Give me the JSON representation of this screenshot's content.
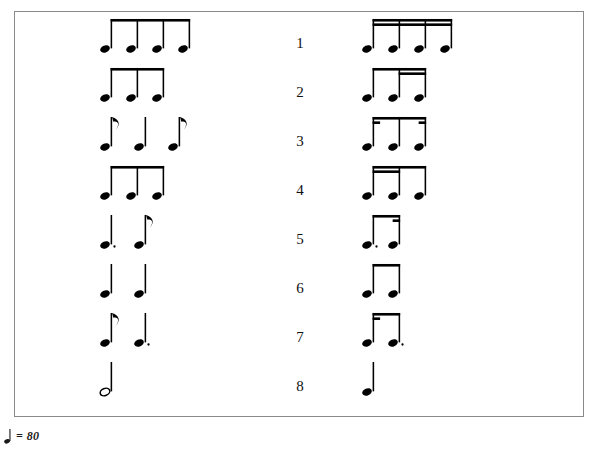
{
  "document": {
    "type": "rhythm-dictation-worksheet",
    "border_color": "#8a8a8a",
    "ink_color": "#000000"
  },
  "tempo": {
    "note_icon": "quarter-note-icon",
    "equals": "=",
    "bpm": "80",
    "text": "= 80"
  },
  "rows": [
    {
      "number": "1",
      "left": {
        "description": "four eighth notes beamed",
        "notes": [
          {
            "value": "eighth",
            "dotted": false
          },
          {
            "value": "eighth",
            "dotted": false
          },
          {
            "value": "eighth",
            "dotted": false
          },
          {
            "value": "eighth",
            "dotted": false
          }
        ],
        "beams": 1
      },
      "right": {
        "description": "four sixteenth notes double beamed",
        "notes": [
          {
            "value": "sixteenth",
            "dotted": false
          },
          {
            "value": "sixteenth",
            "dotted": false
          },
          {
            "value": "sixteenth",
            "dotted": false
          },
          {
            "value": "sixteenth",
            "dotted": false
          }
        ],
        "beams": 2
      }
    },
    {
      "number": "2",
      "left": {
        "description": "quarter note then two beamed eighth notes",
        "notes": [
          {
            "value": "quarter",
            "dotted": false
          },
          {
            "value": "eighth",
            "dotted": false
          },
          {
            "value": "eighth",
            "dotted": false
          }
        ],
        "beams": 1
      },
      "right": {
        "description": "eighth note then two sixteenth notes under one beam",
        "notes": [
          {
            "value": "eighth",
            "dotted": false
          },
          {
            "value": "sixteenth",
            "dotted": false
          },
          {
            "value": "sixteenth",
            "dotted": false
          }
        ],
        "beams": 2
      }
    },
    {
      "number": "3",
      "left": {
        "description": "eighth note, quarter note, eighth note (unbeamed flags)",
        "notes": [
          {
            "value": "eighth",
            "dotted": false
          },
          {
            "value": "quarter",
            "dotted": false
          },
          {
            "value": "eighth",
            "dotted": false
          }
        ],
        "beams": 0
      },
      "right": {
        "description": "sixteenth, eighth, sixteenth beamed with partial beams",
        "notes": [
          {
            "value": "sixteenth",
            "dotted": false
          },
          {
            "value": "eighth",
            "dotted": false
          },
          {
            "value": "sixteenth",
            "dotted": false
          }
        ],
        "beams": 1
      }
    },
    {
      "number": "4",
      "left": {
        "description": "two beamed eighth notes then a quarter note",
        "notes": [
          {
            "value": "eighth",
            "dotted": false
          },
          {
            "value": "eighth",
            "dotted": false
          },
          {
            "value": "quarter",
            "dotted": false
          }
        ],
        "beams": 1
      },
      "right": {
        "description": "two sixteenth notes then an eighth note under one beam",
        "notes": [
          {
            "value": "sixteenth",
            "dotted": false
          },
          {
            "value": "sixteenth",
            "dotted": false
          },
          {
            "value": "eighth",
            "dotted": false
          }
        ],
        "beams": 2
      }
    },
    {
      "number": "5",
      "left": {
        "description": "dotted quarter note then an eighth note",
        "notes": [
          {
            "value": "quarter",
            "dotted": true
          },
          {
            "value": "eighth",
            "dotted": false
          }
        ],
        "beams": 0
      },
      "right": {
        "description": "dotted eighth note beamed to a sixteenth note",
        "notes": [
          {
            "value": "eighth",
            "dotted": true
          },
          {
            "value": "sixteenth",
            "dotted": false
          }
        ],
        "beams": 1
      }
    },
    {
      "number": "6",
      "left": {
        "description": "two quarter notes",
        "notes": [
          {
            "value": "quarter",
            "dotted": false
          },
          {
            "value": "quarter",
            "dotted": false
          }
        ],
        "beams": 0
      },
      "right": {
        "description": "two beamed eighth notes",
        "notes": [
          {
            "value": "eighth",
            "dotted": false
          },
          {
            "value": "eighth",
            "dotted": false
          }
        ],
        "beams": 1
      }
    },
    {
      "number": "7",
      "left": {
        "description": "eighth note then dotted quarter note",
        "notes": [
          {
            "value": "eighth",
            "dotted": false
          },
          {
            "value": "quarter",
            "dotted": true
          }
        ],
        "beams": 0
      },
      "right": {
        "description": "sixteenth note beamed to a dotted eighth note",
        "notes": [
          {
            "value": "sixteenth",
            "dotted": false
          },
          {
            "value": "eighth",
            "dotted": true
          }
        ],
        "beams": 1
      }
    },
    {
      "number": "8",
      "left": {
        "description": "one half note",
        "notes": [
          {
            "value": "half",
            "dotted": false
          }
        ],
        "beams": 0
      },
      "right": {
        "description": "one quarter note",
        "notes": [
          {
            "value": "quarter",
            "dotted": false
          }
        ],
        "beams": 0
      }
    }
  ]
}
